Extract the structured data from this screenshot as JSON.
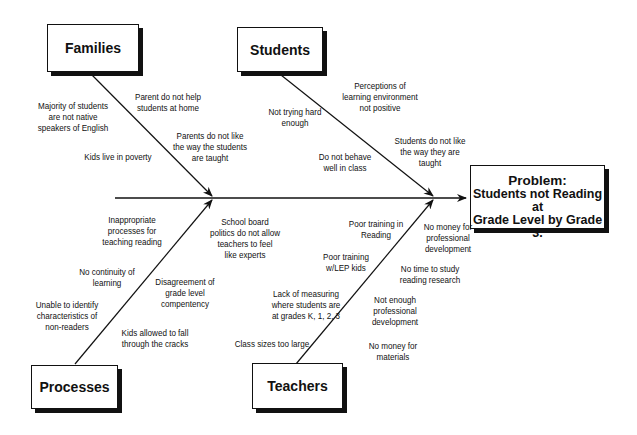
{
  "problem": {
    "title": "Problem:",
    "line1": "Students not Reading at",
    "line2": "Grade Level by Grade 3."
  },
  "categories": {
    "families": {
      "label": "Families",
      "causes": [
        "Majority of students\nare not native\nspeakers of English",
        "Parent do not help\nstudents at home",
        "Parents do not like\nthe way the students\nare taught",
        "Kids live in poverty"
      ]
    },
    "students": {
      "label": "Students",
      "causes": [
        "Perceptions of\nlearning environment\nnot positive",
        "Not trying hard\nenough",
        "Students do not like\nthe way they are\ntaught",
        "Do not  behave\nwell in class"
      ]
    },
    "processes": {
      "label": "Processes",
      "causes": [
        "Inappropriate\nprocesses for\nteaching reading",
        "School board\npolitics do not allow\nteachers to feel\nlike experts",
        "No continuity of\nlearning",
        "Disagreement of\ngrade level\ncompentency",
        "Unable to identify\ncharacteristics of\nnon-readers",
        "Kids allowed to fall\nthrough the cracks"
      ]
    },
    "teachers": {
      "label": "Teachers",
      "causes": [
        "Poor training in\nReading",
        "No money for\nprofessional\ndevelopment",
        "Poor training\nw/LEP kids",
        "No time to study\nreading research",
        "Lack of measuring\nwhere students are\nat grades K, 1, 2, 3",
        "Not enough\nprofessional\ndevelopment",
        "Class sizes too large",
        "No money for\nmaterials"
      ]
    }
  }
}
